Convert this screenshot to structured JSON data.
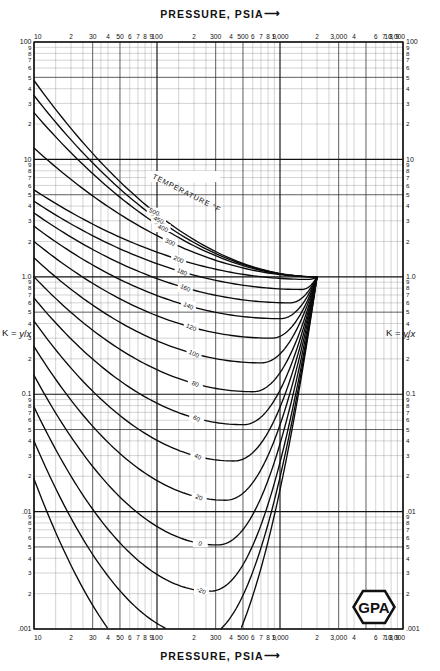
{
  "chart_data": {
    "type": "line",
    "xlabel": "PRESSURE, PSIA",
    "ylabel": "K = y/x",
    "xscale": "log",
    "yscale": "log",
    "xlim": [
      10,
      10000
    ],
    "ylim": [
      0.001,
      100
    ],
    "grid": true,
    "legend_position": "inline-curve-labels",
    "convergence_pressure": 2000,
    "convergence_k": 1.0,
    "series_label": "TEMPERATURE °F",
    "x_ticks": [
      "10",
      "30",
      "50",
      "100",
      "300",
      "500",
      "1,000",
      "3,000",
      "10,000"
    ],
    "x_minor_ticks": [
      "2",
      "4",
      "6",
      "7",
      "8",
      "9"
    ],
    "y_ticks": [
      "100",
      "10",
      "1.0",
      "0.1",
      ".01",
      ".001"
    ],
    "y_minor_ticks": [
      "9",
      "8",
      "7",
      "6",
      "5",
      "4",
      "3",
      "2"
    ],
    "series": [
      {
        "name": "500",
        "label": "500",
        "k_at_10psia": 47.0,
        "k_min": 1.0,
        "p_min": 2000
      },
      {
        "name": "450",
        "label": "450",
        "k_at_10psia": 35.0,
        "k_min": 1.0,
        "p_min": 2000
      },
      {
        "name": "400",
        "label": "400",
        "k_at_10psia": 25.0,
        "k_min": 1.0,
        "p_min": 2000
      },
      {
        "name": "300",
        "label": "300",
        "k_at_10psia": 12.5,
        "k_min": 1.0,
        "p_min": 2000
      },
      {
        "name": "200",
        "label": "200",
        "k_at_10psia": 5.5,
        "k_min": 0.95,
        "p_min": 1700
      },
      {
        "name": "180",
        "label": "180",
        "k_at_10psia": 4.4,
        "k_min": 0.78,
        "p_min": 1500
      },
      {
        "name": "160",
        "label": "160",
        "k_at_10psia": 3.5,
        "k_min": 0.6,
        "p_min": 1200
      },
      {
        "name": "140",
        "label": "140",
        "k_at_10psia": 2.7,
        "k_min": 0.44,
        "p_min": 1000
      },
      {
        "name": "120",
        "label": "120",
        "k_at_10psia": 2.0,
        "k_min": 0.3,
        "p_min": 850
      },
      {
        "name": "100",
        "label": "100",
        "k_at_10psia": 1.45,
        "k_min": 0.185,
        "p_min": 700
      },
      {
        "name": "80",
        "label": "80",
        "k_at_10psia": 1.0,
        "k_min": 0.105,
        "p_min": 600
      },
      {
        "name": "60",
        "label": "60",
        "k_at_10psia": 0.66,
        "k_min": 0.055,
        "p_min": 500
      },
      {
        "name": "40",
        "label": "40",
        "k_at_10psia": 0.42,
        "k_min": 0.027,
        "p_min": 420
      },
      {
        "name": "20",
        "label": "20",
        "k_at_10psia": 0.255,
        "k_min": 0.0125,
        "p_min": 360
      },
      {
        "name": "0",
        "label": "0",
        "k_at_10psia": 0.145,
        "k_min": 0.0052,
        "p_min": 310
      },
      {
        "name": "-20",
        "label": "-20",
        "k_at_10psia": 0.078,
        "k_min": 0.0021,
        "p_min": 270
      },
      {
        "name": "-40",
        "label": "-40",
        "k_at_10psia": 0.04,
        "k_min": 0.00085,
        "p_min": 230
      },
      {
        "name": "-60",
        "label": "-60",
        "k_at_10psia": 0.019,
        "k_min": 0.00032,
        "p_min": 190
      }
    ]
  },
  "header": {
    "top_axis_title": "PRESSURE, PSIA",
    "arrow": "⟶"
  },
  "footer": {
    "bottom_axis_title": "PRESSURE, PSIA",
    "arrow": "⟶"
  },
  "y_axis": {
    "label_prefix": "K = ",
    "label_numerator": "y",
    "label_slash": "/",
    "label_denominator": "x"
  },
  "curves_header": {
    "text": "TEMPERATURE  °F"
  },
  "logo": {
    "text": "GPA",
    "shape": "hexagon-badge"
  }
}
